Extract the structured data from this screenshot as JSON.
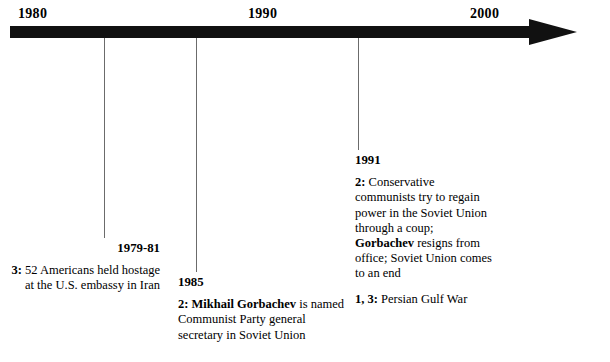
{
  "axis": {
    "arrow_icon": "right-arrow-icon",
    "years": [
      {
        "label": "1980",
        "x": 18
      },
      {
        "label": "1990",
        "x": 248
      },
      {
        "label": "2000",
        "x": 470
      }
    ]
  },
  "ticks": [
    {
      "name": "tick-1979",
      "x": 104,
      "top": 38,
      "height": 200
    },
    {
      "name": "tick-1985",
      "x": 196,
      "top": 38,
      "height": 234
    },
    {
      "name": "tick-1991",
      "x": 358,
      "top": 38,
      "height": 112
    }
  ],
  "events": [
    {
      "year": "1979-81",
      "entries": [
        {
          "key": "3:",
          "text_before": " 52 Americans held hostage at the U.S. embassy in Iran",
          "bold_mid": "",
          "text_after": ""
        }
      ]
    },
    {
      "year": "1985",
      "entries": [
        {
          "key": "2:",
          "text_before": " ",
          "bold_mid": "Mikhail Gorbachev",
          "text_after": " is named Communist Party general secretary in Soviet Union"
        }
      ]
    },
    {
      "year": "1991",
      "entries": [
        {
          "key": "2:",
          "text_before": " Conservative communists try to regain power in the Soviet Union through a coup; ",
          "bold_mid": "Gorbachev",
          "text_after": " resigns from office; Soviet Union comes to an end"
        },
        {
          "key": "1, 3:",
          "text_before": " Persian Gulf War",
          "bold_mid": "",
          "text_after": ""
        }
      ]
    }
  ],
  "colors": {
    "axis": "#111111",
    "leader_line": "#6b6b6b",
    "text": "#000000",
    "background": "#ffffff"
  }
}
